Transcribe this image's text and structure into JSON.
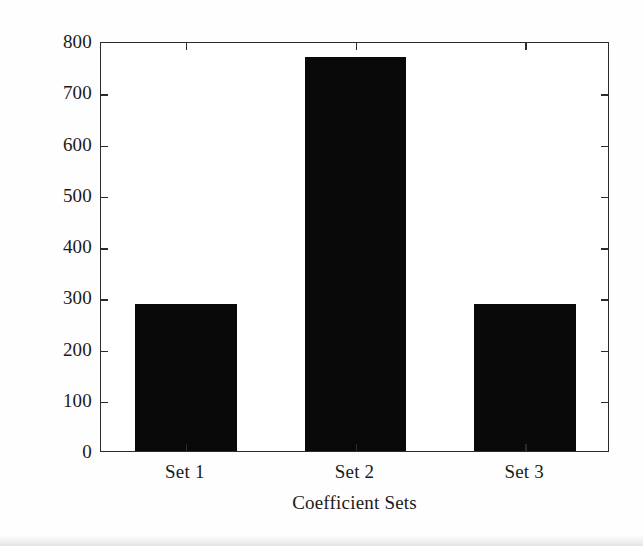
{
  "chart_data": {
    "type": "bar",
    "title": "",
    "xlabel": "Coefficient Sets",
    "ylabel": "Network Lifetime (s)",
    "categories": [
      "Set 1",
      "Set 2",
      "Set 3"
    ],
    "values": [
      287,
      768,
      287
    ],
    "ylim": [
      0,
      800
    ],
    "yticks": [
      0,
      100,
      200,
      300,
      400,
      500,
      600,
      700,
      800
    ],
    "ytick_labels": [
      "0",
      "100",
      "200",
      "300",
      "400",
      "500",
      "600",
      "700",
      "800"
    ],
    "grid": false,
    "legend": null,
    "bar_color": "#090909",
    "axis_color": "#2b2b2b",
    "background_color": "#ffffff",
    "tick_direction": "in",
    "box": true
  }
}
